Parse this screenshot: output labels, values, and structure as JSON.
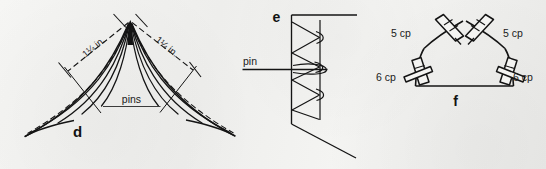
{
  "figure": {
    "background_color": "#f2f2f0",
    "ink_color": "#141414",
    "panels": [
      {
        "id": "d",
        "letter": "d",
        "name": "fan-of-threads-with-pins",
        "annotations": {
          "pins_label": "pins",
          "dimension_left": "1¼ in.",
          "dimension_right": "1¼ in."
        }
      },
      {
        "id": "e",
        "letter": "e",
        "name": "zigzag-coil-around-pin",
        "annotations": {
          "pin_label": "pin"
        }
      },
      {
        "id": "f",
        "letter": "f",
        "name": "pentagon-frame-with-clothespins",
        "annotations": {
          "clip_top_left": "5 cp",
          "clip_top_right": "5 cp",
          "clip_bottom_left": "6 cp",
          "clip_bottom_right": "6 cp"
        }
      }
    ]
  }
}
